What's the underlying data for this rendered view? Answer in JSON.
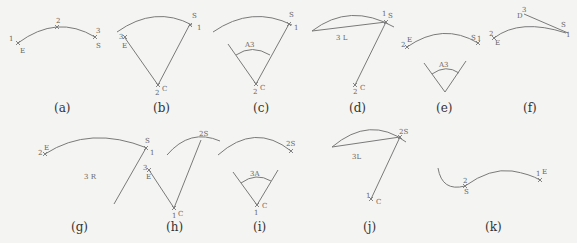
{
  "figure": {
    "panels": [
      {
        "id": "a",
        "caption": "(a)",
        "labels": {
          "p1": "1",
          "e": "E",
          "p2": "2",
          "p3": "3",
          "s": "S"
        }
      },
      {
        "id": "b",
        "caption": "(b)",
        "labels": {
          "p3": "3",
          "e": "E",
          "s": "S",
          "p1": "1",
          "p2": "2",
          "c": "C"
        }
      },
      {
        "id": "c",
        "caption": "(c)",
        "labels": {
          "s": "S",
          "p1": "1",
          "angle": "A3",
          "p2": "2",
          "c": "C"
        }
      },
      {
        "id": "d",
        "caption": "(d)",
        "labels": {
          "chord": "3 L",
          "p1": "1",
          "s": "S",
          "p2": "2",
          "c": "C"
        }
      },
      {
        "id": "e",
        "caption": "(e)",
        "labels": {
          "p2": "2",
          "e": "E",
          "s": "S",
          "p1": "1",
          "angle": "A3"
        }
      },
      {
        "id": "f",
        "caption": "(f)",
        "labels": {
          "d": "D",
          "p3": "3",
          "p2": "2",
          "e": "E",
          "s": "S",
          "p1": "1"
        }
      },
      {
        "id": "g",
        "caption": "(g)",
        "labels": {
          "p2": "2",
          "e": "E",
          "s": "S",
          "p1": "1",
          "radius": "3 R"
        }
      },
      {
        "id": "h",
        "caption": "(h)",
        "labels": {
          "p3": "3",
          "e": "E",
          "p1": "1",
          "c": "C",
          "p2s": "2S"
        }
      },
      {
        "id": "i",
        "caption": "(i)",
        "labels": {
          "p2s": "2S",
          "angle": "3A",
          "p1": "1",
          "c": "C"
        }
      },
      {
        "id": "j",
        "caption": "(j)",
        "labels": {
          "chord": "3L",
          "p2s": "2S",
          "p1": "1",
          "c": "C"
        }
      },
      {
        "id": "k",
        "caption": "(k)",
        "labels": {
          "p2": "2",
          "s": "S",
          "p1": "1",
          "e": "E"
        }
      }
    ]
  }
}
